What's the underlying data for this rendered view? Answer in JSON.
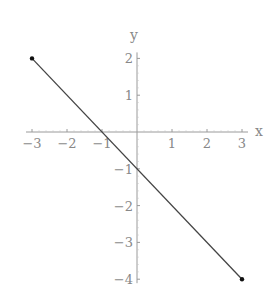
{
  "chart_data": {
    "type": "line",
    "title": "",
    "xlabel": "x",
    "ylabel": "y",
    "xlim": [
      -3,
      3
    ],
    "ylim": [
      -4,
      2
    ],
    "xticks": [
      -3,
      -2,
      -1,
      1,
      2,
      3
    ],
    "yticks": [
      2,
      1,
      -1,
      -2,
      -3,
      -4
    ],
    "xtick_labels": [
      "-3",
      "-2",
      "-1",
      "1",
      "2",
      "3"
    ],
    "ytick_labels": [
      "2",
      "1",
      "-1",
      "-2",
      "-3",
      "-4"
    ],
    "grid": false,
    "series": [
      {
        "name": "y = -x - 1",
        "x": [
          -3,
          3
        ],
        "y": [
          2,
          -4
        ],
        "endpoints_marked": true
      }
    ]
  },
  "colors": {
    "axis": "#9a9a9a",
    "line": "#444444",
    "point": "#111111",
    "text": "#888888"
  }
}
